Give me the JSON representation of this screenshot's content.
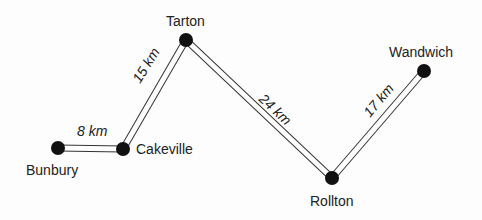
{
  "towns": [
    {
      "name": "Bunbury",
      "x": 58,
      "y": 148,
      "lx": 26,
      "ly": 175
    },
    {
      "name": "Cakeville",
      "x": 123,
      "y": 149,
      "lx": 136,
      "ly": 154
    },
    {
      "name": "Tarton",
      "x": 186,
      "y": 40,
      "lx": 166,
      "ly": 26
    },
    {
      "name": "Rollton",
      "x": 332,
      "y": 178,
      "lx": 310,
      "ly": 206
    },
    {
      "name": "Wandwich",
      "x": 424,
      "y": 71,
      "lx": 389,
      "ly": 57
    }
  ],
  "roads": [
    {
      "from": "Bunbury",
      "to": "Cakeville",
      "distance": "8 km",
      "lx": 77,
      "ly": 136,
      "rot": 0
    },
    {
      "from": "Cakeville",
      "to": "Tarton",
      "distance": "15 km",
      "lx": 140,
      "ly": 84,
      "rot": -58
    },
    {
      "from": "Tarton",
      "to": "Rollton",
      "distance": "24 km",
      "lx": 258,
      "ly": 100,
      "rot": 43
    },
    {
      "from": "Rollton",
      "to": "Wandwich",
      "distance": "17 km",
      "lx": 370,
      "ly": 118,
      "rot": -50
    }
  ]
}
